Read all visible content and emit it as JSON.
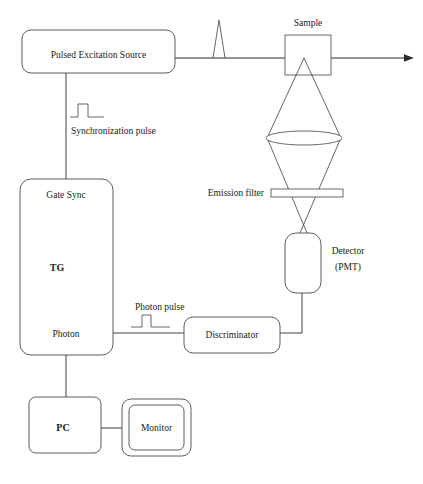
{
  "diagram": {
    "background_color": "#ffffff",
    "line_color": "#2b2b2b",
    "text_color": "#1a1a1a",
    "blocks": {
      "pulsed_excitation_source": "Pulsed Excitation Source",
      "gate_sync": "Gate Sync",
      "tg": "TG",
      "photon": "Photon",
      "discriminator": "Discriminator",
      "pc": "PC",
      "monitor": "Monitor",
      "detector_line1": "Detector",
      "detector_line2": "(PMT)"
    },
    "labels": {
      "sample": "Sample",
      "synchronization_pulse": "Synchronization pulse",
      "photon_pulse": "Photon pulse",
      "emission_filter": "Emission filter"
    },
    "signal_shapes": {
      "excitation_pulse": "narrow-triangular-spike",
      "synchronization_pulse": "square-pulse",
      "photon_pulse": "square-pulse"
    },
    "optics": {
      "lens": "convex-lens-ellipse",
      "filter": "thin-rectangle-filter",
      "sample_cell": "square-cuvette",
      "beam_direction": "left-to-right-arrow"
    },
    "connections": [
      "Pulsed Excitation Source → beam → Sample → transmitted beam arrow",
      "Pulsed Excitation Source ↓ Synchronization pulse → Gate Sync (TG)",
      "Sample ↓ emission cone → lens → Emission filter → Detector (PMT)",
      "Detector (PMT) → Discriminator → Photon pulse → TG Photon input",
      "TG ↓ PC ↔ Monitor"
    ]
  }
}
